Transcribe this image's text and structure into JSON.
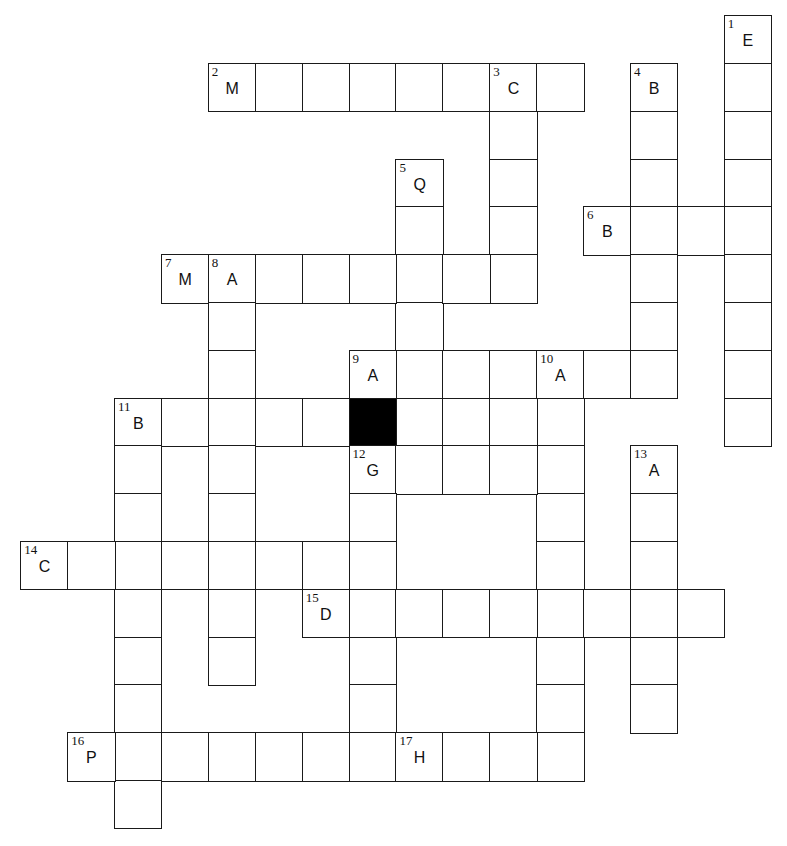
{
  "puzzle": {
    "grid": {
      "origin_x": 21,
      "origin_y": 16,
      "cell_w": 46.9,
      "cell_h": 47.8,
      "cols": 16,
      "rows": 17
    },
    "black_cells": [
      [
        8,
        7
      ]
    ],
    "entries": [
      {
        "number": 1,
        "direction": "down",
        "row": 0,
        "col": 15,
        "length": 9,
        "first_letter": "E"
      },
      {
        "number": 2,
        "direction": "across",
        "row": 1,
        "col": 4,
        "length": 8,
        "first_letter": "M"
      },
      {
        "number": 3,
        "direction": "down",
        "row": 1,
        "col": 10,
        "length": 5,
        "first_letter": "C"
      },
      {
        "number": 4,
        "direction": "down",
        "row": 1,
        "col": 13,
        "length": 7,
        "first_letter": "B"
      },
      {
        "number": 5,
        "direction": "down",
        "row": 3,
        "col": 8,
        "length": 6,
        "first_letter": "Q"
      },
      {
        "number": 6,
        "direction": "across",
        "row": 4,
        "col": 12,
        "length": 4,
        "first_letter": "B"
      },
      {
        "number": 7,
        "direction": "across",
        "row": 5,
        "col": 3,
        "length": 8,
        "first_letter": "M"
      },
      {
        "number": 8,
        "direction": "down",
        "row": 5,
        "col": 4,
        "length": 9,
        "first_letter": "A"
      },
      {
        "number": 9,
        "direction": "across",
        "row": 7,
        "col": 7,
        "length": 7,
        "first_letter": "A"
      },
      {
        "number": 10,
        "direction": "down",
        "row": 7,
        "col": 11,
        "length": 9,
        "first_letter": "A"
      },
      {
        "number": 11,
        "direction": "across",
        "row": 8,
        "col": 2,
        "length": 10,
        "first_letter": "B"
      },
      {
        "number": 11,
        "direction": "down",
        "row": 8,
        "col": 2,
        "length": 9,
        "first_letter": "B"
      },
      {
        "number": 12,
        "direction": "across",
        "row": 9,
        "col": 7,
        "length": 5,
        "first_letter": "G"
      },
      {
        "number": 12,
        "direction": "down",
        "row": 9,
        "col": 7,
        "length": 6,
        "first_letter": "G"
      },
      {
        "number": 13,
        "direction": "down",
        "row": 9,
        "col": 13,
        "length": 6,
        "first_letter": "A"
      },
      {
        "number": 14,
        "direction": "across",
        "row": 11,
        "col": 0,
        "length": 7,
        "first_letter": "C"
      },
      {
        "number": 15,
        "direction": "across",
        "row": 12,
        "col": 6,
        "length": 9,
        "first_letter": "D"
      },
      {
        "number": 16,
        "direction": "across",
        "row": 15,
        "col": 1,
        "length": 7,
        "first_letter": "P"
      },
      {
        "number": 17,
        "direction": "across",
        "row": 15,
        "col": 8,
        "length": 4,
        "first_letter": "H"
      }
    ]
  }
}
